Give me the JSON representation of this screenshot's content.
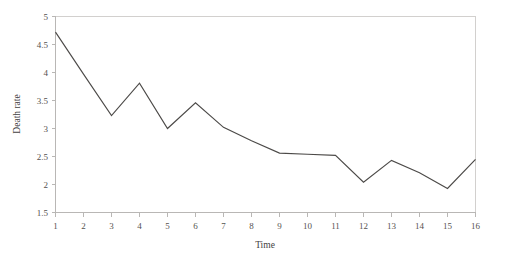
{
  "chart_data": {
    "type": "line",
    "title": "",
    "xlabel": "Time",
    "ylabel": "Death rate",
    "x": [
      1,
      2,
      3,
      4,
      5,
      6,
      7,
      8,
      9,
      10,
      11,
      12,
      13,
      14,
      15,
      16
    ],
    "values": [
      4.72,
      3.97,
      3.23,
      3.81,
      3.0,
      3.46,
      3.02,
      2.78,
      2.56,
      2.54,
      2.52,
      2.04,
      2.43,
      2.21,
      1.93,
      2.45
    ],
    "series": [
      {
        "name": "Death rate",
        "values": [
          4.72,
          3.97,
          3.23,
          3.81,
          3.0,
          3.46,
          3.02,
          2.78,
          2.56,
          2.54,
          2.52,
          2.04,
          2.43,
          2.21,
          1.93,
          2.45
        ]
      }
    ],
    "xlim": [
      1,
      16
    ],
    "ylim": [
      1.5,
      5
    ],
    "xticks": [
      "1",
      "2",
      "3",
      "4",
      "5",
      "6",
      "7",
      "8",
      "9",
      "10",
      "11",
      "12",
      "13",
      "14",
      "15",
      "16"
    ],
    "yticks": [
      "1.5",
      "2",
      "2.5",
      "3",
      "3.5",
      "4",
      "4.5",
      "5"
    ],
    "ytick_values": [
      1.5,
      2,
      2.5,
      3,
      3.5,
      4,
      4.5,
      5
    ],
    "grid": false,
    "legend": "none",
    "line_color": "#4c4a48",
    "axis_color": "#b9b7b5",
    "frame_color": "#d2d0ce",
    "background": "#ffffff"
  }
}
